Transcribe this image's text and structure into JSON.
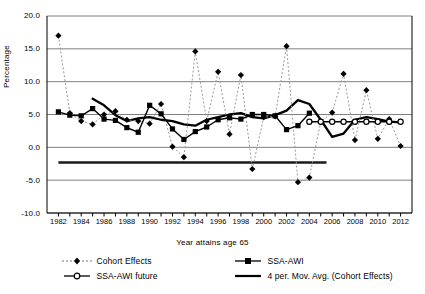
{
  "chart_data": {
    "type": "line",
    "title": "",
    "xlabel": "Year attains age 65",
    "ylabel": "Percentage",
    "xlim": [
      1981,
      2013
    ],
    "ylim": [
      -10.0,
      20.0
    ],
    "grid": true,
    "legend_position": "bottom",
    "x": [
      1982,
      1983,
      1984,
      1985,
      1986,
      1987,
      1988,
      1989,
      1990,
      1991,
      1992,
      1993,
      1994,
      1995,
      1996,
      1997,
      1998,
      1999,
      2000,
      2001,
      2002,
      2003,
      2004,
      2005,
      2006,
      2007,
      2008,
      2009,
      2010,
      2011,
      2012
    ],
    "xticklabels": [
      "1982",
      "1984",
      "1986",
      "1988",
      "1990",
      "1992",
      "1994",
      "1996",
      "1998",
      "2000",
      "2002",
      "2004",
      "2006",
      "2008",
      "2010",
      "2012"
    ],
    "yticklabels": [
      "20.0",
      "15.0",
      "10.0",
      "5.0",
      "0.0",
      "-5.0",
      "-10.0"
    ],
    "yticks": [
      20.0,
      15.0,
      10.0,
      5.0,
      0.0,
      -5.0,
      -10.0
    ],
    "series": [
      {
        "name": "Cohort Effects",
        "style": "dotted-diamond",
        "color": "#000000",
        "x": [
          1982,
          1983,
          1984,
          1985,
          1986,
          1987,
          1988,
          1989,
          1990,
          1991,
          1992,
          1993,
          1994,
          1995,
          1996,
          1997,
          1998,
          1999,
          2000,
          2001,
          2002,
          2003,
          2004,
          2005,
          2006,
          2007,
          2008,
          2009,
          2010,
          2011,
          2012
        ],
        "values": [
          17.0,
          5.2,
          4.0,
          3.5,
          5.0,
          5.5,
          4.2,
          4.0,
          3.6,
          6.6,
          0.1,
          -1.5,
          14.6,
          4.0,
          11.5,
          2.0,
          11.0,
          -3.3,
          4.6,
          4.7,
          15.4,
          -5.3,
          -4.6,
          3.9,
          5.3,
          11.2,
          1.1,
          8.7,
          1.3,
          4.3,
          0.2
        ]
      },
      {
        "name": "SSA-AWI",
        "style": "solid-square",
        "color": "#000000",
        "x": [
          1982,
          1983,
          1984,
          1985,
          1986,
          1987,
          1988,
          1989,
          1990,
          1991,
          1992,
          1993,
          1994,
          1995,
          1996,
          1997,
          1998,
          1999,
          2000,
          2001,
          2002,
          2003,
          2004
        ],
        "values": [
          5.4,
          4.9,
          4.8,
          5.9,
          4.3,
          4.1,
          3.0,
          2.3,
          6.4,
          5.1,
          2.8,
          1.2,
          2.4,
          3.1,
          4.2,
          4.5,
          4.3,
          5.0,
          5.0,
          4.8,
          2.7,
          3.3,
          5.2
        ]
      },
      {
        "name": "SSA-AWI future",
        "style": "solid-open-circle",
        "color": "#000000",
        "x": [
          2004,
          2005,
          2006,
          2007,
          2008,
          2009,
          2010,
          2011,
          2012
        ],
        "values": [
          3.9,
          3.9,
          3.9,
          3.9,
          3.9,
          3.9,
          3.9,
          3.9,
          3.9
        ]
      },
      {
        "name": "4 per. Mov. Avg. (Cohort Effects)",
        "style": "thick-line",
        "color": "#000000",
        "x": [
          1985,
          1986,
          1987,
          1988,
          1989,
          1990,
          1991,
          1992,
          1993,
          1994,
          1995,
          1996,
          1997,
          1998,
          1999,
          2000,
          2001,
          2002,
          2003,
          2004,
          2005,
          2006,
          2007,
          2008,
          2009,
          2010,
          2011,
          2012
        ],
        "values": [
          7.4,
          6.4,
          4.9,
          4.0,
          4.4,
          4.6,
          4.2,
          4.0,
          3.5,
          3.3,
          4.2,
          4.6,
          5.0,
          5.2,
          4.6,
          4.4,
          4.9,
          5.6,
          7.2,
          6.6,
          4.2,
          1.6,
          2.1,
          4.2,
          4.6,
          4.3,
          3.9,
          3.8
        ]
      }
    ],
    "annotations": [
      {
        "name": "baseline-rule",
        "type": "hline",
        "y": -2.3,
        "x_start": 1982,
        "x_end": 2005.5
      }
    ]
  },
  "legend": {
    "items": [
      {
        "label": "Cohort Effects",
        "marker": "diamond-marker",
        "line": "dotted"
      },
      {
        "label": "SSA-AWI",
        "marker": "square-marker",
        "line": "solid"
      },
      {
        "label": "SSA-AWI future",
        "marker": "open-circle-marker",
        "line": "solid"
      },
      {
        "label": "4 per. Mov. Avg. (Cohort Effects)",
        "marker": "none",
        "line": "thick"
      }
    ]
  }
}
